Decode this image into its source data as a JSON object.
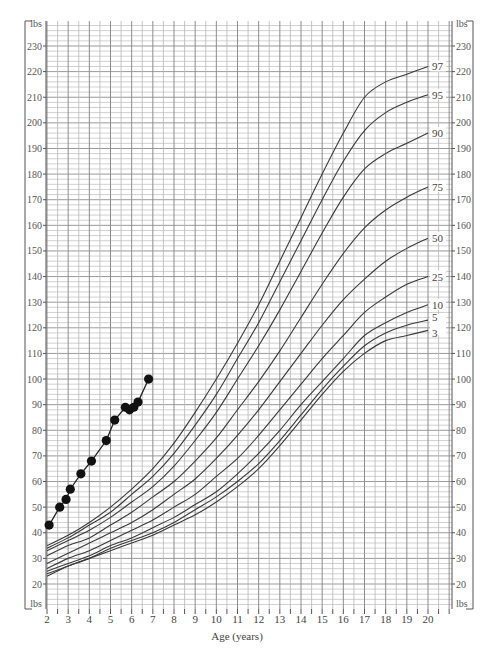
{
  "chart_data": {
    "type": "line",
    "title": "",
    "xlabel": "Age (years)",
    "ylabel": "lbs",
    "xlim": [
      2,
      20
    ],
    "ylim": [
      20,
      230
    ],
    "x_ticks": [
      2,
      3,
      4,
      5,
      6,
      7,
      8,
      9,
      10,
      11,
      12,
      13,
      14,
      15,
      16,
      17,
      18,
      19,
      20
    ],
    "y_ticks": [
      20,
      30,
      40,
      50,
      60,
      70,
      80,
      90,
      100,
      110,
      120,
      130,
      140,
      150,
      160,
      170,
      180,
      190,
      200,
      210,
      220,
      230
    ],
    "y_unit_label_top": "lbs",
    "y_unit_label_bottom": "lbs",
    "grid": true,
    "percentile_ages": [
      2,
      3,
      4,
      5,
      6,
      7,
      8,
      9,
      10,
      11,
      12,
      13,
      14,
      15,
      16,
      17,
      18,
      19,
      20
    ],
    "series": [
      {
        "name": "97",
        "values": [
          35,
          39,
          44,
          50,
          57,
          65,
          75,
          87,
          100,
          114,
          129,
          146,
          163,
          180,
          196,
          210,
          216,
          219,
          222
        ]
      },
      {
        "name": "95",
        "values": [
          34,
          38,
          43,
          48,
          55,
          62,
          71,
          82,
          94,
          108,
          122,
          138,
          154,
          170,
          185,
          197,
          204,
          208,
          211
        ]
      },
      {
        "name": "90",
        "values": [
          33,
          37,
          41,
          46,
          52,
          58,
          66,
          76,
          87,
          100,
          113,
          127,
          142,
          157,
          171,
          182,
          188,
          192,
          196
        ]
      },
      {
        "name": "75",
        "values": [
          31,
          35,
          38,
          43,
          48,
          54,
          60,
          68,
          77,
          88,
          99,
          111,
          124,
          137,
          149,
          159,
          166,
          171,
          175
        ]
      },
      {
        "name": "50",
        "values": [
          28,
          32,
          36,
          40,
          44,
          49,
          55,
          61,
          69,
          78,
          88,
          99,
          110,
          121,
          131,
          139,
          146,
          151,
          155
        ]
      },
      {
        "name": "25",
        "values": [
          26,
          30,
          33,
          37,
          41,
          45,
          50,
          55,
          62,
          69,
          78,
          88,
          98,
          108,
          117,
          126,
          132,
          137,
          140
        ]
      },
      {
        "name": "10",
        "values": [
          25,
          28,
          31,
          35,
          38,
          42,
          46,
          51,
          56,
          63,
          71,
          80,
          90,
          99,
          108,
          117,
          122,
          126,
          129
        ]
      },
      {
        "name": "5",
        "values": [
          24,
          27,
          30,
          34,
          37,
          40,
          44,
          49,
          54,
          60,
          67,
          76,
          86,
          96,
          105,
          113,
          118,
          121,
          123
        ]
      },
      {
        "name": "3",
        "values": [
          23,
          27,
          30,
          33,
          36,
          39,
          43,
          47,
          52,
          58,
          65,
          74,
          84,
          94,
          103,
          110,
          115,
          117,
          119
        ]
      }
    ],
    "patient": {
      "name": "Patient weight",
      "x": [
        2.1,
        2.6,
        2.9,
        3.1,
        3.6,
        4.1,
        4.8,
        5.2,
        5.7,
        5.9,
        6.1,
        6.3,
        6.8
      ],
      "y": [
        43,
        50,
        53,
        57,
        63,
        68,
        76,
        84,
        89,
        88,
        89,
        91,
        100
      ]
    }
  }
}
